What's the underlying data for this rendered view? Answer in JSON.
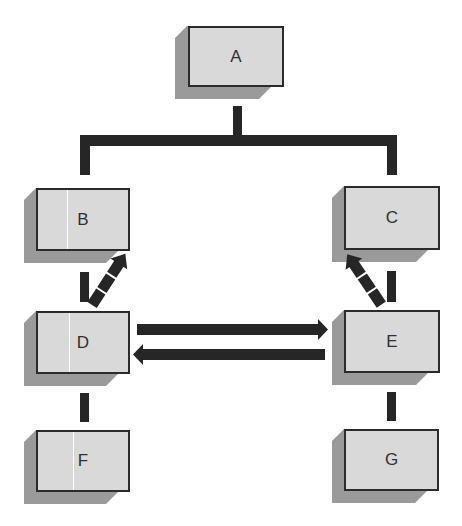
{
  "diagram": {
    "type": "hierarchy-with-relations",
    "colors": {
      "face": "#d9d9d9",
      "shadow": "#9a9a9a",
      "border": "#2b2b2b",
      "connector": "#262626",
      "label": "#303030"
    },
    "nodes": [
      {
        "id": "A",
        "label": "A"
      },
      {
        "id": "B",
        "label": "B"
      },
      {
        "id": "C",
        "label": "C"
      },
      {
        "id": "D",
        "label": "D"
      },
      {
        "id": "E",
        "label": "E"
      },
      {
        "id": "F",
        "label": "F"
      },
      {
        "id": "G",
        "label": "G"
      }
    ],
    "edges": [
      {
        "from": "A",
        "to": "B",
        "style": "tree-connector"
      },
      {
        "from": "A",
        "to": "C",
        "style": "tree-connector"
      },
      {
        "from": "B",
        "to": "D",
        "style": "solid-bar"
      },
      {
        "from": "D",
        "to": "F",
        "style": "solid-bar"
      },
      {
        "from": "C",
        "to": "E",
        "style": "solid-bar"
      },
      {
        "from": "E",
        "to": "G",
        "style": "solid-bar"
      },
      {
        "from": "D",
        "to": "B",
        "style": "dashed-arrow"
      },
      {
        "from": "E",
        "to": "C",
        "style": "dashed-arrow"
      },
      {
        "from": "D",
        "to": "E",
        "style": "arrow"
      },
      {
        "from": "E",
        "to": "D",
        "style": "arrow"
      }
    ]
  }
}
